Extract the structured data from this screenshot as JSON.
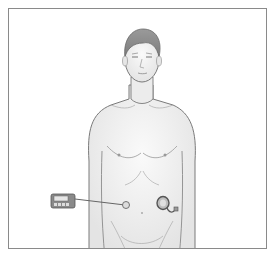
{
  "figure": {
    "colors": {
      "frame_border": "#8a8a8a",
      "skin": "#f0f0f0",
      "outline": "#7a7a7a",
      "hair": "#8c8c8c",
      "device": "#6e6e6e"
    },
    "labels": []
  }
}
